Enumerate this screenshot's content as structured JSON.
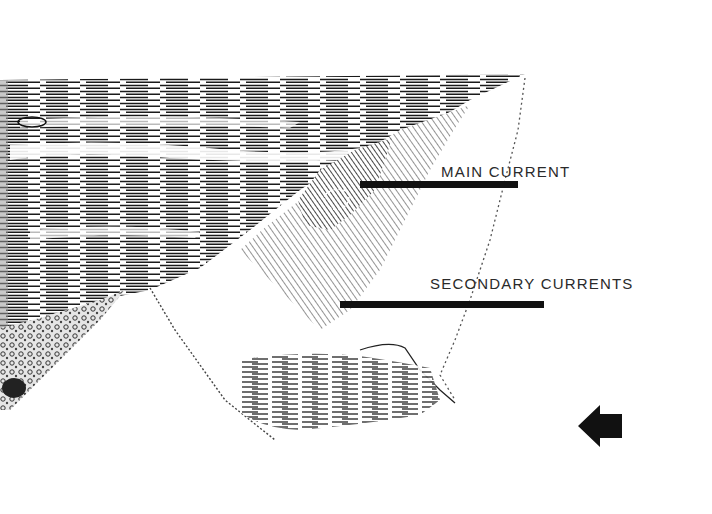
{
  "diagram": {
    "labels": {
      "main_current": "MAIN CURRENT",
      "secondary_currents": "SECONDARY CURRENTS"
    },
    "icons": {
      "direction_arrow": "arrow-left-icon"
    },
    "colors": {
      "background": "#ffffff",
      "ink": "#111111",
      "label_text": "#2a2a2a"
    }
  }
}
